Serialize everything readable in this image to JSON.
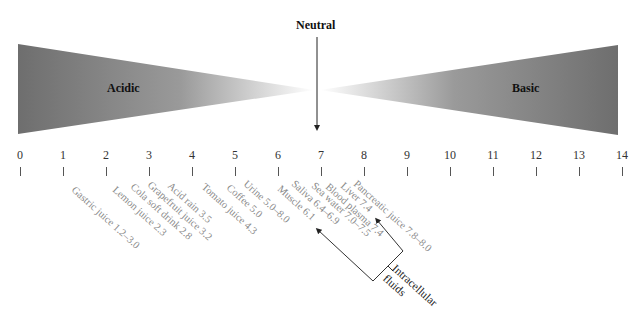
{
  "labels": {
    "neutral": "Neutral",
    "acidic": "Acidic",
    "basic": "Basic",
    "intracellular_line1": "Intracellular",
    "intracellular_line2": "fluids"
  },
  "scale": {
    "ticks": [
      "0",
      "1",
      "2",
      "3",
      "4",
      "5",
      "6",
      "7",
      "8",
      "9",
      "10",
      "11",
      "12",
      "13",
      "14"
    ]
  },
  "examples": [
    {
      "label": "Gastric juice 1.2–3.0",
      "x": 77,
      "y": 184
    },
    {
      "label": "Lemon juice 2.3",
      "x": 118,
      "y": 184
    },
    {
      "label": "Cola soft drink 2.8",
      "x": 136,
      "y": 181
    },
    {
      "label": "Grapefruit juice 3.2",
      "x": 153,
      "y": 179
    },
    {
      "label": "Acid rain 3.5",
      "x": 173,
      "y": 180
    },
    {
      "label": "Tomato juice 4.3",
      "x": 207,
      "y": 181
    },
    {
      "label": "Coffee 5.0",
      "x": 232,
      "y": 182
    },
    {
      "label": "Urine 5.0–8.0",
      "x": 249,
      "y": 178
    },
    {
      "label": "Muscle 6.1",
      "x": 283,
      "y": 183
    },
    {
      "label": "Saliva 6.4–6.9",
      "x": 297,
      "y": 178
    },
    {
      "label": "Sea water 7.0–7.5",
      "x": 317,
      "y": 180
    },
    {
      "label": "Blood plasma 7.4",
      "x": 331,
      "y": 181
    },
    {
      "label": "Liver 7.4",
      "x": 346,
      "y": 180
    },
    {
      "label": "Pancreatic juice 7.8–8.0",
      "x": 359,
      "y": 178
    }
  ],
  "colors": {
    "gradient_dark": "#6e6e6e",
    "gradient_light": "#ffffff",
    "example_text": "#8a8a8a"
  }
}
